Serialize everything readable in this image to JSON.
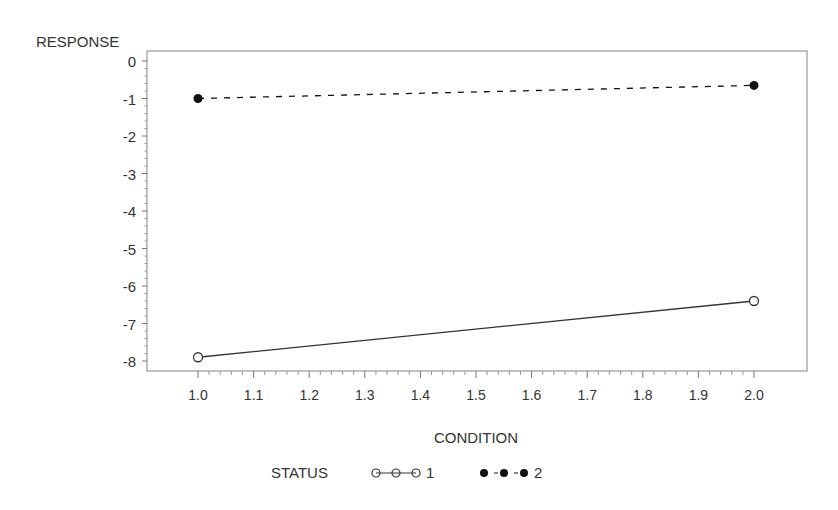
{
  "chart_data": {
    "type": "line",
    "title": "",
    "xlabel": "CONDITION",
    "ylabel": "RESPONSE",
    "xlim": [
      0.95,
      2.1
    ],
    "ylim": [
      -8.2,
      0.2
    ],
    "x_ticks": [
      "1.0",
      "1.1",
      "1.2",
      "1.3",
      "1.4",
      "1.5",
      "1.6",
      "1.7",
      "1.8",
      "1.9",
      "2.0"
    ],
    "y_ticks": [
      "0",
      "-1",
      "-2",
      "-3",
      "-4",
      "-5",
      "-6",
      "-7",
      "-8"
    ],
    "grid": false,
    "legend": {
      "title": "STATUS",
      "position": "bottom"
    },
    "x": [
      1.0,
      2.0
    ],
    "series": [
      {
        "name": "1",
        "values": [
          -7.9,
          -6.4
        ],
        "line": "solid",
        "marker": "open-circle",
        "color": "#333333"
      },
      {
        "name": "2",
        "values": [
          -1.0,
          -0.65
        ],
        "line": "dashed",
        "marker": "filled-circle",
        "color": "#111111"
      }
    ]
  }
}
